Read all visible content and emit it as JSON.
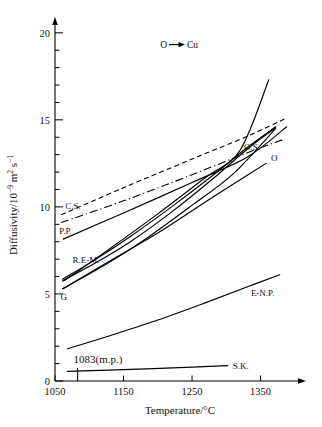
{
  "chart_data": {
    "type": "line",
    "title": "",
    "annotation": "O → Cu",
    "annotation_species": "O",
    "annotation_arrow": "→",
    "annotation_target": "Cu",
    "xlabel": "Temperature/°C",
    "ylabel": "Diffusivity/10⁻⁹ m² s⁻¹",
    "ylabel_parts": {
      "prefix": "Diffusivity/10",
      "exp1": "−9",
      "mid": " m",
      "exp2": "2",
      "unit": " s",
      "exp3": "−1"
    },
    "xlim": [
      1050,
      1390
    ],
    "ylim": [
      0,
      21
    ],
    "xticks": [
      1050,
      1150,
      1250,
      1350
    ],
    "xtick_labels": [
      "1050",
      "1150",
      "1250",
      "1350"
    ],
    "yticks": [
      0,
      5,
      10,
      15,
      20
    ],
    "ytick_labels": [
      "0",
      "5",
      "10",
      "15",
      "20"
    ],
    "y_minor_step": 1,
    "grid": false,
    "legend_position": "inline-curve-labels",
    "melting_point": {
      "value": 1083,
      "label": "1083(m.p.)",
      "marker": "vertical-tick"
    },
    "series": [
      {
        "name": "C.S.",
        "label": "C.S.",
        "style": "dashed",
        "points": [
          [
            1059,
            9.55
          ],
          [
            1150,
            11.1
          ],
          [
            1250,
            12.75
          ],
          [
            1330,
            14.05
          ],
          [
            1385,
            15.05
          ]
        ]
      },
      {
        "name": "P.P.",
        "label": "P.P.",
        "style": "dash-dot",
        "points": [
          [
            1059,
            9.1
          ],
          [
            1150,
            10.35
          ],
          [
            1250,
            11.85
          ],
          [
            1330,
            13.1
          ],
          [
            1385,
            13.9
          ]
        ]
      },
      {
        "name": "R.E-M.-upper",
        "label": "",
        "style": "solid",
        "points": [
          [
            1062,
            8.15
          ],
          [
            1150,
            9.65
          ],
          [
            1250,
            11.4
          ],
          [
            1330,
            12.85
          ],
          [
            1388,
            14.6
          ]
        ]
      },
      {
        "name": "R.E-M.-a",
        "label": "R.E-M.",
        "style": "solid",
        "points": [
          [
            1061,
            5.85
          ],
          [
            1110,
            7.0
          ],
          [
            1160,
            8.3
          ],
          [
            1220,
            10.0
          ],
          [
            1280,
            11.8
          ],
          [
            1330,
            13.4
          ],
          [
            1372,
            14.6
          ]
        ]
      },
      {
        "name": "R.E-M.-b",
        "label": "",
        "style": "solid",
        "points": [
          [
            1061,
            5.75
          ],
          [
            1110,
            6.8
          ],
          [
            1160,
            8.0
          ],
          [
            1220,
            9.7
          ],
          [
            1280,
            11.6
          ],
          [
            1330,
            13.3
          ],
          [
            1372,
            14.55
          ]
        ]
      },
      {
        "name": "G",
        "label": "G",
        "style": "solid",
        "points": [
          [
            1061,
            5.3
          ],
          [
            1120,
            6.6
          ],
          [
            1180,
            8.1
          ],
          [
            1250,
            10.1
          ],
          [
            1310,
            11.9
          ],
          [
            1372,
            14.5
          ]
        ]
      },
      {
        "name": "O.S.",
        "label": "O.S.",
        "style": "solid",
        "points": [
          [
            1063,
            5.75
          ],
          [
            1130,
            7.6
          ],
          [
            1200,
            9.6
          ],
          [
            1270,
            11.7
          ],
          [
            1320,
            13.25
          ],
          [
            1362,
            17.3
          ]
        ]
      },
      {
        "name": "O",
        "label": "O",
        "style": "solid",
        "points": [
          [
            1062,
            5.3
          ],
          [
            1130,
            6.9
          ],
          [
            1200,
            8.5
          ],
          [
            1270,
            10.3
          ],
          [
            1330,
            11.8
          ],
          [
            1358,
            12.5
          ]
        ]
      },
      {
        "name": "E-N.P.",
        "label": "E-N.P.",
        "style": "solid",
        "points": [
          [
            1068,
            1.85
          ],
          [
            1130,
            2.6
          ],
          [
            1200,
            3.5
          ],
          [
            1270,
            4.5
          ],
          [
            1330,
            5.4
          ],
          [
            1378,
            6.1
          ]
        ]
      },
      {
        "name": "S.K.",
        "label": "S.K.",
        "style": "solid",
        "points": [
          [
            1068,
            0.55
          ],
          [
            1150,
            0.65
          ],
          [
            1250,
            0.8
          ],
          [
            1302,
            0.88
          ]
        ]
      }
    ]
  },
  "figure": {
    "x_axis_name": "temperature-axis",
    "y_axis_name": "diffusivity-axis"
  }
}
